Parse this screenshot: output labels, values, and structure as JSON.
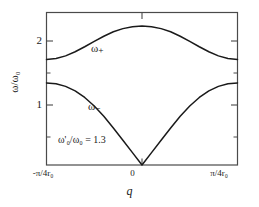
{
  "chart_data": {
    "type": "line",
    "title": "",
    "xlabel": "q",
    "ylabel": "ω/ω₀",
    "xlim": [
      -1,
      1
    ],
    "ylim": [
      0,
      2.6
    ],
    "grid": false,
    "legend_position": "inline-annotation",
    "xtick_labels": [
      "-π/4r₀",
      "0",
      "π/4r₀"
    ],
    "xtick_values": [
      -1,
      0,
      1
    ],
    "ytick_labels": [
      "1",
      "2"
    ],
    "ytick_values": [
      1,
      2
    ],
    "annotations": [
      {
        "text": "ω'₀/ω₀ = 1.3",
        "x": -0.55,
        "y": 0.48
      },
      {
        "text": "ω₊",
        "x": -0.18,
        "y": 2.0
      },
      {
        "text": "ω₋",
        "x": -0.22,
        "y": 1.02
      }
    ],
    "series": [
      {
        "name": "ω₊",
        "x": [
          -1.0,
          -0.9,
          -0.8,
          -0.7,
          -0.6,
          -0.5,
          -0.4,
          -0.3,
          -0.2,
          -0.1,
          0.0,
          0.1,
          0.2,
          0.3,
          0.4,
          0.5,
          0.6,
          0.7,
          0.8,
          0.9,
          1.0
        ],
        "values": [
          1.8,
          1.815,
          1.861,
          1.931,
          2.016,
          2.107,
          2.195,
          2.271,
          2.325,
          2.357,
          2.368,
          2.357,
          2.325,
          2.271,
          2.195,
          2.107,
          2.016,
          1.931,
          1.861,
          1.815,
          1.8
        ]
      },
      {
        "name": "ω₋",
        "x": [
          -1.0,
          -0.9,
          -0.8,
          -0.7,
          -0.6,
          -0.5,
          -0.4,
          -0.3,
          -0.2,
          -0.1,
          0.0,
          0.1,
          0.2,
          0.3,
          0.4,
          0.5,
          0.6,
          0.7,
          0.8,
          0.9,
          1.0
        ],
        "values": [
          1.4,
          1.386,
          1.341,
          1.263,
          1.151,
          1.006,
          0.83,
          0.63,
          0.421,
          0.211,
          0.0,
          0.211,
          0.421,
          0.63,
          0.83,
          1.006,
          1.151,
          1.263,
          1.341,
          1.386,
          1.4
        ]
      }
    ]
  },
  "axes": {
    "y_title": "ω/ω₀",
    "x_title": "q",
    "y_ticks": [
      "2",
      "1"
    ],
    "x_ticks": {
      "left": "-π/4r₀",
      "middle": "0",
      "right": "π/4r₀"
    }
  },
  "labels": {
    "upper_branch": "ω₊",
    "lower_branch": "ω₋",
    "ratio_annotation": "ω'₀/ω₀ = 1.3"
  },
  "colors": {
    "curve": "#1a1a1a",
    "frame": "#4a4a4a",
    "background": "#ffffff"
  }
}
